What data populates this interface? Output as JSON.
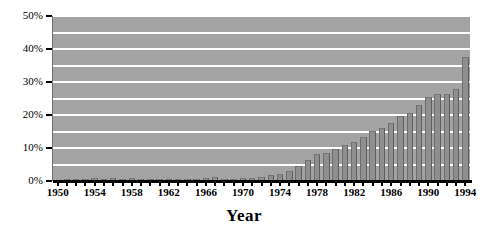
{
  "chart_data": {
    "type": "bar",
    "title": "",
    "xlabel": "Year",
    "ylabel": "",
    "ylim": [
      0,
      50
    ],
    "ytick_labels": [
      "0%",
      "10%",
      "20%",
      "30%",
      "40%",
      "50%"
    ],
    "ytick_values": [
      0,
      10,
      20,
      30,
      40,
      50
    ],
    "grid": true,
    "grid_interval": 5,
    "legend": "none",
    "xtick_labels": [
      "1950",
      "1954",
      "1958",
      "1962",
      "1966",
      "1970",
      "1974",
      "1978",
      "1982",
      "1986",
      "1990",
      "1994"
    ],
    "xtick_values": [
      1950,
      1954,
      1958,
      1962,
      1966,
      1970,
      1974,
      1978,
      1982,
      1986,
      1990,
      1994
    ],
    "categories": [
      "1950",
      "1951",
      "1952",
      "1953",
      "1954",
      "1955",
      "1956",
      "1957",
      "1958",
      "1959",
      "1960",
      "1961",
      "1962",
      "1963",
      "1964",
      "1965",
      "1966",
      "1967",
      "1968",
      "1969",
      "1970",
      "1971",
      "1972",
      "1973",
      "1974",
      "1975",
      "1976",
      "1977",
      "1978",
      "1979",
      "1980",
      "1981",
      "1982",
      "1983",
      "1984",
      "1985",
      "1986",
      "1987",
      "1988",
      "1989",
      "1990",
      "1991",
      "1992",
      "1993",
      "1994"
    ],
    "values": [
      0.4,
      0.5,
      0.5,
      0.6,
      0.9,
      0.7,
      1.0,
      0.7,
      0.9,
      0.7,
      0.7,
      0.6,
      0.7,
      0.6,
      0.7,
      0.6,
      0.9,
      1.1,
      0.7,
      0.7,
      0.8,
      1.0,
      1.3,
      1.8,
      2.2,
      3.0,
      4.4,
      6.4,
      8.1,
      8.6,
      9.7,
      11.0,
      11.8,
      13.2,
      15.3,
      16.2,
      17.5,
      19.8,
      20.5,
      23.0,
      25.5,
      26.4,
      26.4,
      27.8,
      37.5
    ],
    "colors": {
      "bar": "#8f8f8f",
      "plot_background": "#a3a3a3",
      "gridline": "#ffffff",
      "axis": "#000000",
      "page_background": "#ffffff"
    }
  }
}
